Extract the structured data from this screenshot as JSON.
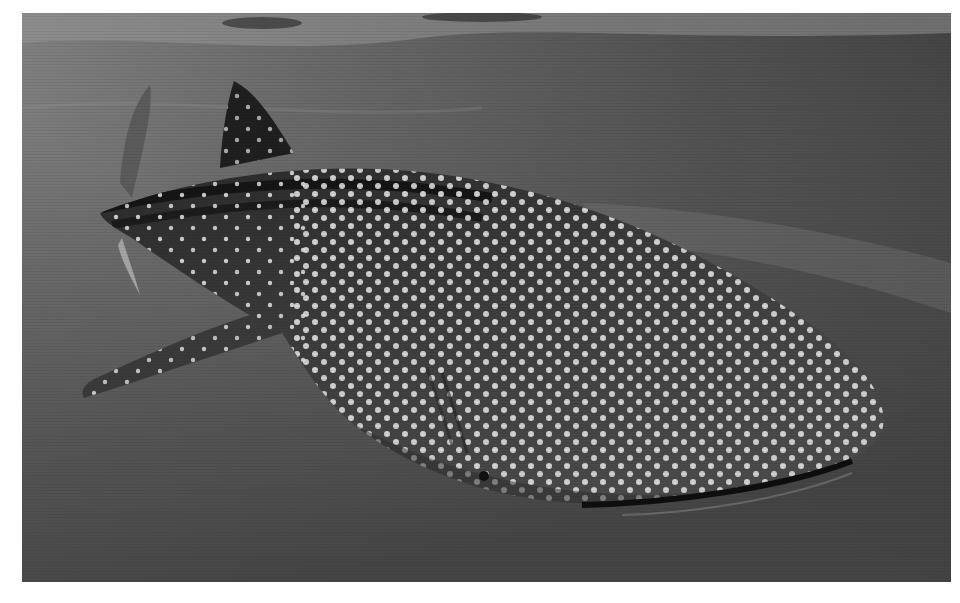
{
  "image": {
    "subject": "Whale shark swimming underwater",
    "style": "grayscale photograph",
    "background_color": "#ffffff",
    "frame": {
      "x": 22,
      "y": 13,
      "width": 929,
      "height": 569
    },
    "colors": {
      "water_top": "#8a8a8a",
      "water_mid": "#6a6a6a",
      "water_bottom": "#474747",
      "shark_body": "#3a3a3a",
      "shark_dark": "#1e1e1e",
      "spots": "#e6e6e6"
    }
  }
}
